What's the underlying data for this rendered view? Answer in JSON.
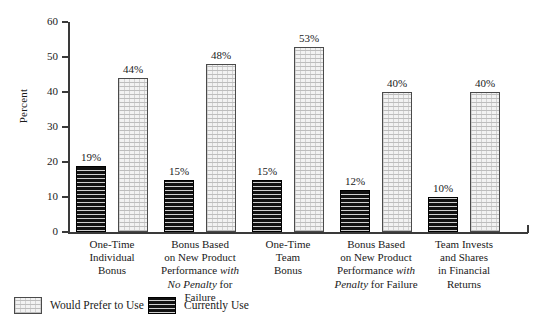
{
  "chart_data": {
    "type": "bar",
    "title": "",
    "xlabel": "",
    "ylabel": "Percent",
    "ylim": [
      0,
      60
    ],
    "yticks": [
      0,
      10,
      20,
      30,
      40,
      50,
      60
    ],
    "grid": false,
    "legend_position": "bottom-left",
    "categories": [
      "One-Time Individual Bonus",
      "Bonus Based on New Product Performance with No Penalty for Failure",
      "One-Time Team Bonus",
      "Bonus Based on New Product Performance with Penalty for Failure",
      "Team Invests and Shares in Financial Returns"
    ],
    "category_label_lines": [
      [
        {
          "text": "One-Time",
          "italic": false
        },
        {
          "text": "Individual",
          "italic": false
        },
        {
          "text": "Bonus",
          "italic": false
        }
      ],
      [
        {
          "text": "Bonus Based",
          "italic": false
        },
        {
          "text": "on New Product",
          "italic": false
        },
        {
          "text": "Performance ",
          "italic": false,
          "suffix_italic": "with"
        },
        {
          "text": "",
          "italic": true,
          "prefix_italic": "No Penalty",
          "suffix": " for Failure"
        }
      ],
      [
        {
          "text": "One-Time",
          "italic": false
        },
        {
          "text": "Team",
          "italic": false
        },
        {
          "text": "Bonus",
          "italic": false
        }
      ],
      [
        {
          "text": "Bonus Based",
          "italic": false
        },
        {
          "text": "on New Product",
          "italic": false
        },
        {
          "text": "Performance ",
          "italic": false,
          "suffix_italic": "with"
        },
        {
          "text": "",
          "italic": true,
          "prefix_italic": "Penalty",
          "suffix": " for Failure"
        }
      ],
      [
        {
          "text": "Team Invests",
          "italic": false
        },
        {
          "text": "and Shares",
          "italic": false
        },
        {
          "text": "in Financial",
          "italic": false
        },
        {
          "text": "Returns",
          "italic": false
        }
      ]
    ],
    "series": [
      {
        "name": "Currently Use",
        "style": "dark",
        "values": [
          19,
          15,
          15,
          12,
          10
        ],
        "labels": [
          "19%",
          "15%",
          "15%",
          "12%",
          "10%"
        ]
      },
      {
        "name": "Would Prefer to Use",
        "style": "light",
        "values": [
          44,
          48,
          53,
          40,
          40
        ],
        "labels": [
          "44%",
          "48%",
          "53%",
          "40%",
          "40%"
        ]
      }
    ]
  },
  "axis": {
    "y_title": "Percent",
    "y_tick_labels": [
      "0",
      "10",
      "20",
      "30",
      "40",
      "50",
      "60"
    ]
  },
  "legend": {
    "items": [
      {
        "label": "Would Prefer to Use",
        "style": "light"
      },
      {
        "label": "Currently Use",
        "style": "dark"
      }
    ]
  },
  "colors": {
    "axis": "#3a3a3a",
    "text": "#1a1a1a",
    "bar_dark_fill": "#111111",
    "bar_light_fill": "#f2f2f2",
    "bar_border": "#4a4a4a",
    "background": "#ffffff"
  },
  "category_lines": {
    "c0": [
      "One-Time",
      "Individual",
      "Bonus"
    ],
    "c1": [
      "Bonus Based",
      "on New Product",
      "Performance with",
      "No Penalty for Failure"
    ],
    "c2": [
      "One-Time",
      "Team",
      "Bonus"
    ],
    "c3": [
      "Bonus Based",
      "on New Product",
      "Performance with",
      "Penalty for Failure"
    ],
    "c4": [
      "Team Invests",
      "and Shares",
      "in Financial",
      "Returns"
    ]
  }
}
